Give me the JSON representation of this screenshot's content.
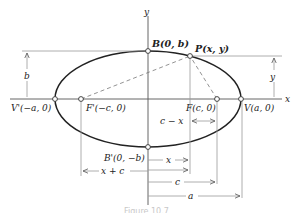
{
  "figure": {
    "type": "ellipse-geometry",
    "caption": "Figure 10.7",
    "axes": {
      "x_label": "x",
      "y_label": "y"
    },
    "points": {
      "B": "B(0, b)",
      "P": "P(x, y)",
      "V_prime": "V'(−a, 0)",
      "F_prime": "F'(−c, 0)",
      "F": "F(c, 0)",
      "V": "V(a, 0)",
      "B_prime": "B'(0, −b)"
    },
    "dimensions": {
      "b": "b",
      "y": "y",
      "c_minus_x": "c − x",
      "x": "x",
      "x_plus_c": "x + c",
      "c": "c",
      "a": "a"
    },
    "colors": {
      "curve": "#222222",
      "guide": "#9a9a9a",
      "background": "#ffffff"
    }
  }
}
